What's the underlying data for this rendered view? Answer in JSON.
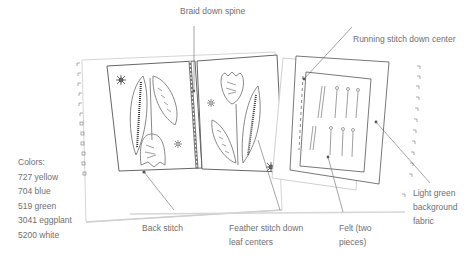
{
  "colors_legend": {
    "heading": "Colors:",
    "items": [
      "727 yellow",
      "704 blue",
      "519 green",
      "3041 eggplant",
      "5200 white"
    ]
  },
  "callouts": {
    "spine": "Braid down spine",
    "running": "Running stitch down center",
    "background": [
      "Light green",
      "background",
      "fabric"
    ],
    "back_stitch": "Back stitch",
    "feather": [
      "Feather stitch down",
      "leaf centers"
    ],
    "felt": [
      "Felt (two",
      "pieces)"
    ]
  },
  "style": {
    "line_color": "#555555",
    "text_color": "#707070",
    "page_shadow": "#d8d8d8"
  }
}
